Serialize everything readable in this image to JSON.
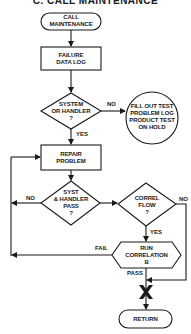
{
  "title": "C.   CALL MAINTENANCE",
  "colors": {
    "stroke": "#1a1a1a",
    "background": "#ffffff"
  },
  "nodes": {
    "call_maintenance": {
      "type": "terminator",
      "label": "CALL\nMAINTENANCE"
    },
    "failure_data_log": {
      "type": "process",
      "label": "FAILURE\nDATA LOG"
    },
    "system_or_handler": {
      "type": "decision",
      "label": "SYSTEM\nOR HANDLER\n?"
    },
    "fill_out_test": {
      "type": "connector-circle",
      "label": "FILL OUT TEST\nPROBLEM LOG\nPRODUCT TEST\nON HOLD"
    },
    "repair_problem": {
      "type": "process",
      "label": "REPAIR\nPROBLEM"
    },
    "syst_handler_pass": {
      "type": "decision",
      "label": "SYST\n& HANDLER\nPASS\n?"
    },
    "correl_flow": {
      "type": "decision",
      "label": "CORREL\nFLOW\n?"
    },
    "run_correlation": {
      "type": "preparation",
      "label": "RUN\nCORRELATION\nB"
    },
    "return": {
      "type": "terminator",
      "label": "RETURN"
    }
  },
  "edges": {
    "system_no": "NO",
    "system_yes": "YES",
    "syst_pass_no": "NO",
    "correl_no": "NO",
    "correl_yes": "YES",
    "run_fail": "FAIL",
    "run_pass": "PASS"
  }
}
